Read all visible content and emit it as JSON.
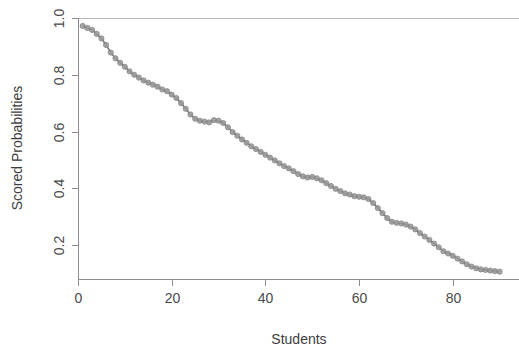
{
  "chart_data": {
    "type": "line",
    "title": "",
    "subtitle": "",
    "xlabel": "Students",
    "ylabel": "Scored Probabilities",
    "xlim": [
      0,
      92
    ],
    "ylim": [
      0.06,
      1.0
    ],
    "grid": false,
    "legend": null,
    "legend_position": "none",
    "marker": "circle",
    "marker_color": "#9a9a9a",
    "line_color": "#6f6f6f",
    "xticks": [
      0,
      20,
      40,
      60,
      80
    ],
    "xtick_labels": [
      "0",
      "20",
      "40",
      "60",
      "80"
    ],
    "yticks": [
      0.2,
      0.4,
      0.6,
      0.8,
      1.0
    ],
    "ytick_labels": [
      "0.2",
      "0.4",
      "0.6",
      "0.8",
      "1.0"
    ],
    "annotations": [
      {
        "type": "hline",
        "y": 1.0,
        "color": "#b8b8b8",
        "label": ""
      }
    ],
    "series": [
      {
        "name": "Scored Probabilities",
        "x": [
          1,
          2,
          3,
          4,
          5,
          6,
          7,
          8,
          9,
          10,
          11,
          12,
          13,
          14,
          15,
          16,
          17,
          18,
          19,
          20,
          21,
          22,
          23,
          24,
          25,
          26,
          27,
          28,
          29,
          30,
          31,
          32,
          33,
          34,
          35,
          36,
          37,
          38,
          39,
          40,
          41,
          42,
          43,
          44,
          45,
          46,
          47,
          48,
          49,
          50,
          51,
          52,
          53,
          54,
          55,
          56,
          57,
          58,
          59,
          60,
          61,
          62,
          63,
          64,
          65,
          66,
          67,
          68,
          69,
          70,
          71,
          72,
          73,
          74,
          75,
          76,
          77,
          78,
          79,
          80,
          81,
          82,
          83,
          84,
          85,
          86,
          87,
          88,
          89,
          90
        ],
        "values": [
          0.972,
          0.965,
          0.958,
          0.944,
          0.928,
          0.905,
          0.878,
          0.858,
          0.842,
          0.828,
          0.812,
          0.8,
          0.79,
          0.78,
          0.772,
          0.765,
          0.758,
          0.748,
          0.742,
          0.73,
          0.718,
          0.7,
          0.68,
          0.66,
          0.645,
          0.638,
          0.635,
          0.632,
          0.64,
          0.638,
          0.63,
          0.615,
          0.598,
          0.585,
          0.572,
          0.56,
          0.548,
          0.538,
          0.528,
          0.518,
          0.508,
          0.498,
          0.488,
          0.478,
          0.47,
          0.46,
          0.45,
          0.442,
          0.438,
          0.44,
          0.435,
          0.428,
          0.418,
          0.408,
          0.398,
          0.39,
          0.382,
          0.378,
          0.372,
          0.37,
          0.368,
          0.362,
          0.348,
          0.33,
          0.312,
          0.295,
          0.282,
          0.278,
          0.276,
          0.272,
          0.265,
          0.255,
          0.242,
          0.23,
          0.218,
          0.205,
          0.192,
          0.178,
          0.17,
          0.162,
          0.152,
          0.142,
          0.132,
          0.124,
          0.118,
          0.114,
          0.112,
          0.11,
          0.108,
          0.106
        ]
      }
    ]
  },
  "axes": {
    "x_title": "Students",
    "y_title": "Scored Probabilities"
  }
}
